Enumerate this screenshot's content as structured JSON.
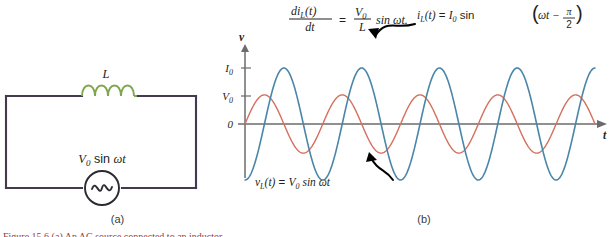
{
  "figure": {
    "caption_fragment": "Figure 15.6 (a) An AC source connected to an inductor.",
    "panel_a_label": "(a)",
    "panel_b_label": "(b)"
  },
  "circuit": {
    "inductor_label": "L",
    "source_label_parts": {
      "v": "V",
      "sub": "0",
      "rest": " sin ",
      "omega": "ω",
      "t": "t"
    },
    "source_label": "V0 sin ωt",
    "wire_color": "#433a4e",
    "inductor_color": "#7fa650",
    "source_symbol": "sine-wave",
    "loop_count": 4
  },
  "equation": {
    "numerator_left": "di",
    "numerator_sub": "L",
    "numerator_arg": "(t)",
    "denominator_left": "dt",
    "equals": "=",
    "numerator_right": "V",
    "numerator_right_sub": "0",
    "denominator_right": "L",
    "tail": " sin ωt.",
    "full": "di_L(t)/dt = (V_0/L) sin ωt."
  },
  "chart_data": {
    "type": "line",
    "title": "",
    "xlabel": "t",
    "ylabel": "v",
    "grid": false,
    "legend": "inline-annotations",
    "x_range": [
      0,
      9.0
    ],
    "y_range": [
      -1.15,
      1.15
    ],
    "x_unit": "radians/π (periods)",
    "cycles_shown": 4.5,
    "y_ticks": [
      {
        "label": "I",
        "sub": "0",
        "value": 1.0
      },
      {
        "label": "V",
        "sub": "0",
        "value": 0.52
      },
      {
        "label": "0",
        "sub": "",
        "value": 0.0
      }
    ],
    "series": [
      {
        "name": "voltage",
        "label_parts": {
          "v": "v",
          "sub": "L",
          "arg": "(t)",
          "eq": " = ",
          "amp": "V",
          "amp_sub": "0",
          "rest": " sin ωt"
        },
        "label": "v_L(t) = V_0 sin ωt",
        "color": "#d4705e",
        "amplitude": 0.52,
        "phase_deg": 0,
        "function": "V0*sin(wt)",
        "linewidth": 1.4
      },
      {
        "name": "current",
        "label_parts": {
          "i": "i",
          "sub": "L",
          "arg": "(t)",
          "eq": " = ",
          "amp": "I",
          "amp_sub": "0",
          "open": " sin ",
          "inner": "ωt − ",
          "num": "π",
          "den": "2"
        },
        "label": "i_L(t) = I_0 sin(ωt − π/2)",
        "color": "#4a86a8",
        "amplitude": 1.0,
        "phase_deg": -90,
        "function": "I0*sin(wt - pi/2)",
        "linewidth": 1.6
      }
    ],
    "annotations": [
      {
        "target": "current",
        "text": "i_L(t) = I_0 sin(ωt − π/2)",
        "arrow": true
      },
      {
        "target": "voltage",
        "text": "v_L(t) = V_0 sin ωt",
        "arrow": true
      }
    ]
  },
  "colors": {
    "axis": "#6b6b6b",
    "text": "#231f20",
    "arrow": "#000000",
    "background": "#ffffff"
  }
}
